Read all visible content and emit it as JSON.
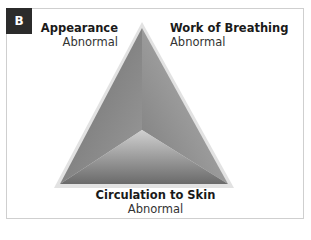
{
  "panel": {
    "badge": "B"
  },
  "diagram": {
    "sides": [
      {
        "name": "Appearance",
        "status": "Abnormal"
      },
      {
        "name": "Work of Breathing",
        "status": "Abnormal"
      },
      {
        "name": "Circulation to Skin",
        "status": "Abnormal"
      }
    ]
  }
}
